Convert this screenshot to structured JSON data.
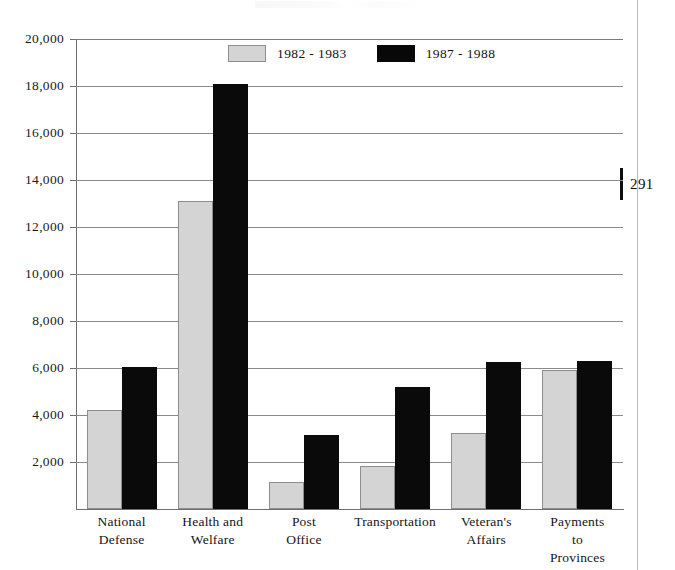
{
  "page": {
    "folio_number": "291"
  },
  "legend": {
    "position": "top-center",
    "entries": [
      {
        "label": "1982 - 1983",
        "color": "#d4d4d4",
        "swatch": "light-swatch"
      },
      {
        "label": "1987 - 1988",
        "color": "#080808",
        "swatch": "dark-swatch"
      }
    ]
  },
  "axis": {
    "y_ticks": [
      "2,000",
      "4,000",
      "6,000",
      "8,000",
      "10,000",
      "12,000",
      "14,000",
      "16,000",
      "18,000",
      "20,000"
    ]
  },
  "chart_data": {
    "type": "bar",
    "title": "",
    "xlabel": "",
    "ylabel": "",
    "ylim": [
      0,
      20000
    ],
    "ytick_values": [
      2000,
      4000,
      6000,
      8000,
      10000,
      12000,
      14000,
      16000,
      18000,
      20000
    ],
    "grid": true,
    "legend_position": "top-center",
    "categories": [
      "National\nDefense",
      "Health and\nWelfare",
      "Post\nOffice",
      "Transportation",
      "Veteran's\nAffairs",
      "Payments to\nProvinces"
    ],
    "series": [
      {
        "name": "1982 - 1983",
        "color": "#d4d4d4",
        "values": [
          4200,
          13100,
          1150,
          1850,
          3250,
          5900
        ]
      },
      {
        "name": "1987 - 1988",
        "color": "#080808",
        "values": [
          6050,
          18100,
          3150,
          5200,
          6250,
          6300
        ]
      }
    ]
  }
}
